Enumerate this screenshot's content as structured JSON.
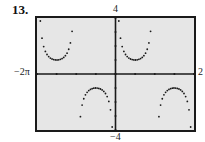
{
  "problem_number": "13.",
  "labels": {
    "ymax": "4",
    "ymin": "−4",
    "xmin": "−2π",
    "xmax": "2"
  },
  "colors": {
    "screen": "#e6e6e6",
    "frame": "#1a1a1a",
    "ink": "#1a1a1a"
  },
  "chart_data": {
    "type": "scatter",
    "title": "",
    "function": "y = csc(x)",
    "xlabel": "",
    "ylabel": "",
    "xlim": [
      -6.2832,
      6.2832
    ],
    "ylim": [
      -4,
      4
    ],
    "x_tick_labels": [
      "−2π",
      "2"
    ],
    "y_tick_labels": [
      "−4",
      "4"
    ],
    "x_ticks_step": 1.5708,
    "y_ticks_step": 1,
    "grid": false,
    "series": [
      {
        "name": "csc(x)",
        "style": "dots",
        "branches": [
          {
            "x_range": [
              -6.0,
              -3.3
            ],
            "sign": "positive",
            "vertex": [
              -4.712,
              1
            ]
          },
          {
            "x_range": [
              -2.9,
              -0.25
            ],
            "sign": "negative",
            "vertex": [
              -1.571,
              -1
            ]
          },
          {
            "x_range": [
              0.25,
              2.9
            ],
            "sign": "positive",
            "vertex": [
              1.571,
              1
            ]
          },
          {
            "x_range": [
              3.3,
              6.0
            ],
            "sign": "negative",
            "vertex": [
              4.712,
              -1
            ]
          }
        ]
      }
    ]
  }
}
